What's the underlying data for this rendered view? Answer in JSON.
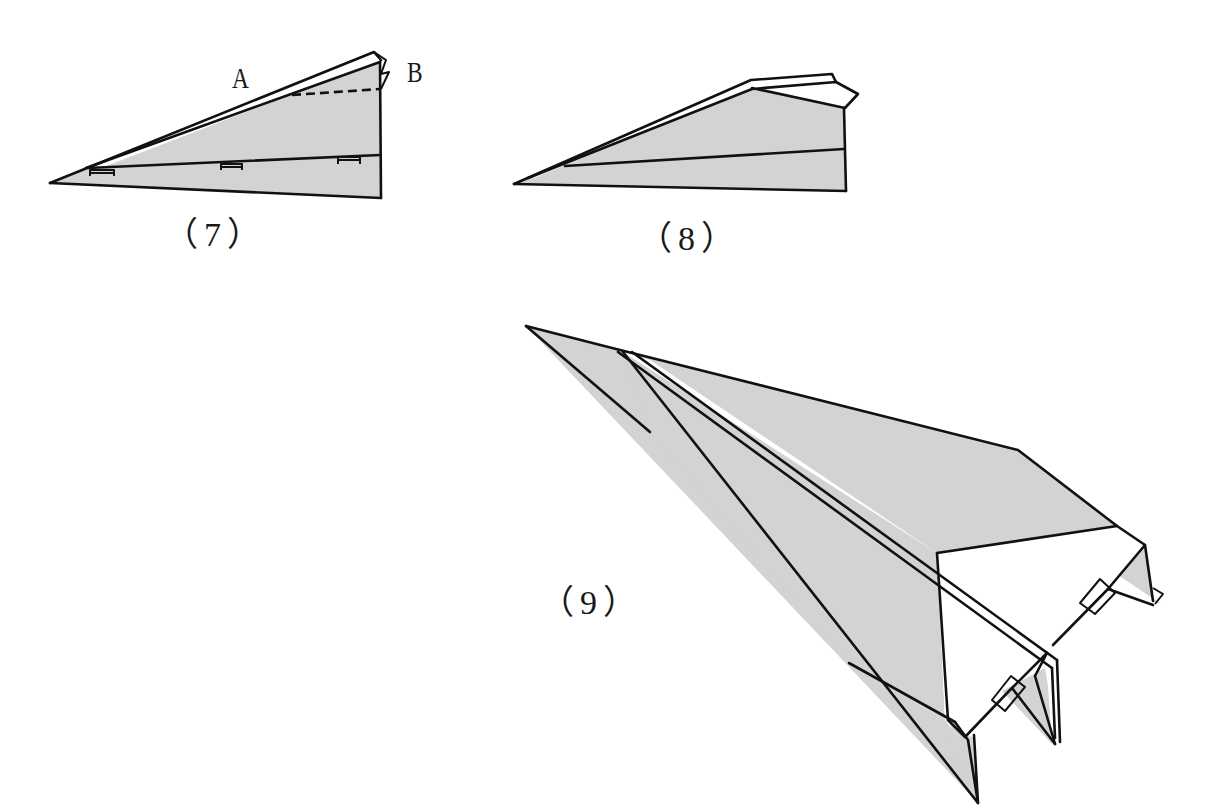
{
  "diagram": {
    "type": "paper-airplane-folding-instructions",
    "fill_color": "#d3d3d3",
    "line_color": "#111111",
    "background": "#ffffff",
    "steps": [
      {
        "id": "step-7",
        "label": "（7）",
        "points": [
          {
            "name": "A",
            "label": "A"
          },
          {
            "name": "B",
            "label": "B"
          }
        ],
        "notes": [
          "dashed fold line from A-side toward B corner",
          "three tab markers along center crease"
        ]
      },
      {
        "id": "step-8",
        "label": "（8）"
      },
      {
        "id": "step-9",
        "label": "（9）"
      }
    ]
  }
}
